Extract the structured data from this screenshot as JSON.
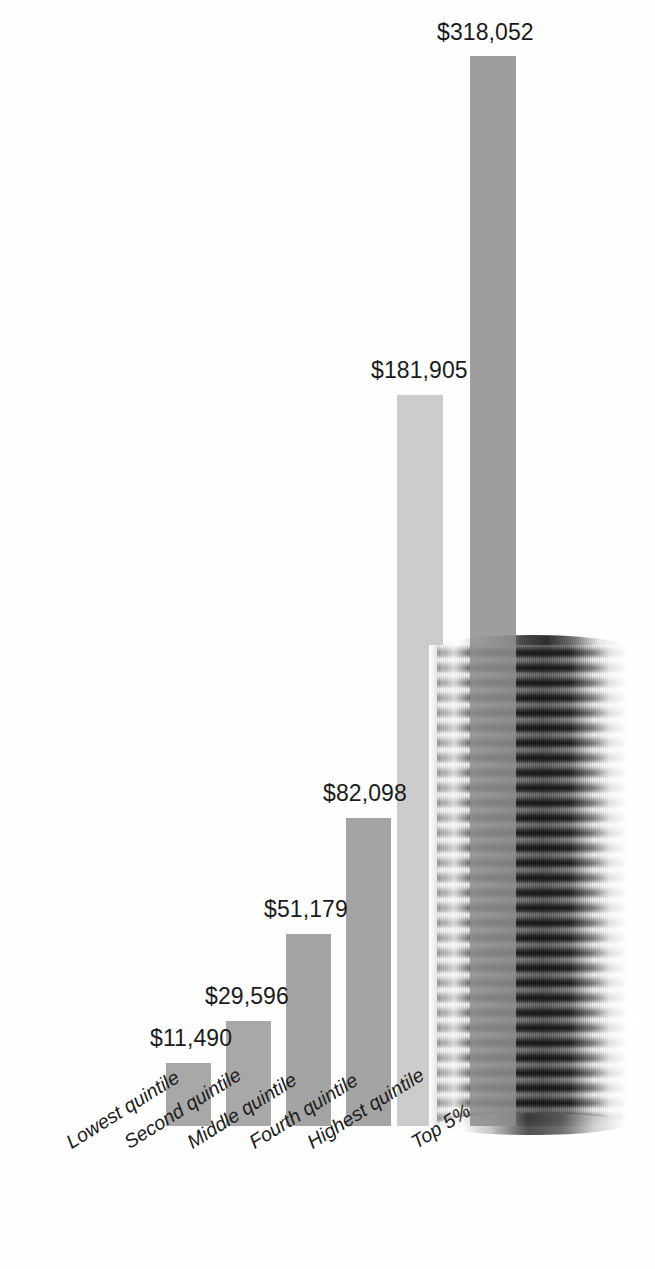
{
  "chart_data": {
    "type": "bar",
    "title": "",
    "subtitle": "",
    "xlabel": "",
    "ylabel": "",
    "grid": false,
    "legend": "none",
    "ylim": [
      0,
      318052
    ],
    "categories": [
      "Lowest quintile",
      "Second quintile",
      "Middle quintile",
      "Fourth quintile",
      "Highest quintile",
      "Top 5%"
    ],
    "values": [
      11490,
      29596,
      51179,
      82098,
      181905,
      318052
    ],
    "value_labels": [
      "$11,490",
      "$29,596",
      "$51,179",
      "$82,098",
      "$181,905",
      "$318,052"
    ],
    "annotations": [
      "Photographic stack of coins behind the two rightmost bars"
    ]
  },
  "bars": [
    {
      "name": "Lowest quintile",
      "label": "$11,490",
      "value": 11490,
      "x": 166,
      "width": 45,
      "height": 63,
      "color": "#a8a8a8",
      "label_x": 150,
      "label_y": 1025
    },
    {
      "name": "Second quintile",
      "label": "$29,596",
      "value": 29596,
      "x": 226,
      "width": 45,
      "height": 105,
      "color": "#a8a8a8",
      "label_x": 205,
      "label_y": 983
    },
    {
      "name": "Middle quintile",
      "label": "$51,179",
      "value": 51179,
      "x": 286,
      "width": 45,
      "height": 192,
      "color": "#a4a4a4",
      "label_x": 264,
      "label_y": 896
    },
    {
      "name": "Fourth quintile",
      "label": "$82,098",
      "value": 82098,
      "x": 346,
      "width": 45,
      "height": 308,
      "color": "#a4a4a4",
      "label_x": 323,
      "label_y": 780
    },
    {
      "name": "Highest quintile",
      "label": "$181,905",
      "value": 181905,
      "x": 397,
      "width": 46,
      "height": 731,
      "color": "#c8c8c8",
      "label_x": 371,
      "label_y": 357
    },
    {
      "name": "Top 5%",
      "label": "$318,052",
      "value": 318052,
      "x": 470,
      "width": 46,
      "height": 1070,
      "color": "#8e8e8e",
      "label_x": 437,
      "label_y": 19
    }
  ],
  "category_labels": [
    {
      "text": "Lowest quintile",
      "x": 62,
      "y": 1134
    },
    {
      "text": "Second quintile",
      "x": 120,
      "y": 1134
    },
    {
      "text": "Middle quintile",
      "x": 183,
      "y": 1134
    },
    {
      "text": "Fourth quintile",
      "x": 245,
      "y": 1134
    },
    {
      "text": "Highest quintile",
      "x": 303,
      "y": 1134
    },
    {
      "text": "Top 5%",
      "x": 407,
      "y": 1134
    }
  ],
  "graphics": {
    "coin_stack_name": "coin-stack-photo"
  },
  "colors": {
    "background": "#ffffff",
    "bar_default": "#a8a8a8",
    "bar_highlight_light": "#c8c8c8",
    "bar_highlight_dark": "#8e8e8e",
    "text": "#1b1b1b"
  }
}
